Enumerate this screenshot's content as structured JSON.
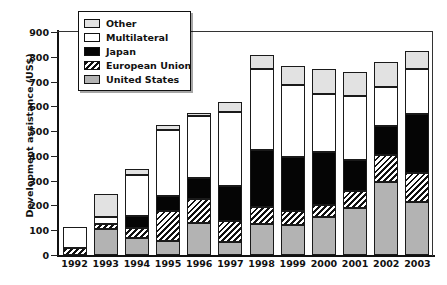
{
  "chart_data": {
    "type": "bar",
    "subtype": "stacked-bar",
    "title": "",
    "xlabel": "",
    "ylabel": "Development assistance (US$)",
    "ylim": [
      0,
      900
    ],
    "yticks": [
      0,
      100,
      200,
      300,
      400,
      500,
      600,
      700,
      800,
      900
    ],
    "grid": false,
    "legend_position": "top-left",
    "categories": [
      "1992",
      "1993",
      "1994",
      "1995",
      "1996",
      "1997",
      "1998",
      "1999",
      "2000",
      "2001",
      "2002",
      "2003"
    ],
    "series": [
      {
        "name": "United States",
        "color": "#b3b3b3",
        "pattern": "solid-gray",
        "values": [
          0,
          105,
          68,
          58,
          128,
          52,
          126,
          120,
          152,
          188,
          293,
          212
        ]
      },
      {
        "name": "European Union",
        "color": "#ffffff",
        "pattern": "diagonal-hatch",
        "values": [
          30,
          20,
          40,
          118,
          98,
          86,
          66,
          56,
          48,
          70,
          110,
          118
        ]
      },
      {
        "name": "Japan",
        "color": "#050505",
        "pattern": "solid-black",
        "values": [
          0,
          0,
          48,
          62,
          83,
          140,
          232,
          218,
          217,
          125,
          117,
          240
        ]
      },
      {
        "name": "Multilateral",
        "color": "#ffffff",
        "pattern": "white",
        "values": [
          85,
          30,
          165,
          265,
          253,
          300,
          325,
          294,
          233,
          257,
          158,
          180
        ]
      },
      {
        "name": "Other",
        "color": "#e2e2e2",
        "pattern": "light-gray",
        "values": [
          0,
          93,
          25,
          22,
          13,
          40,
          60,
          73,
          100,
          97,
          100,
          75
        ]
      }
    ],
    "totals": [
      115,
      248,
      346,
      525,
      575,
      618,
      809,
      761,
      750,
      737,
      778,
      825
    ]
  },
  "legend": {
    "items": [
      {
        "label": "Other",
        "swatch": "light-gray"
      },
      {
        "label": "Multilateral",
        "swatch": "white"
      },
      {
        "label": "Japan",
        "swatch": "black"
      },
      {
        "label": "European Union",
        "swatch": "hatch"
      },
      {
        "label": "United States",
        "swatch": "gray"
      }
    ]
  }
}
